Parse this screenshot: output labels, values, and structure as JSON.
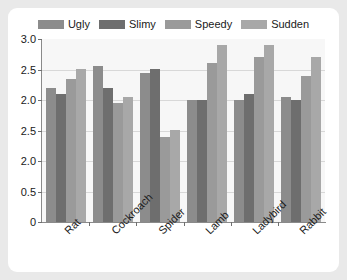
{
  "chart_data": {
    "type": "bar",
    "title": "",
    "xlabel": "",
    "ylabel": "",
    "grid": true,
    "legend_position": "top-center",
    "categories": [
      "Rat",
      "Cockroach",
      "Spider",
      "Lamb",
      "Ladybird",
      "Rabbit"
    ],
    "ytick_labels": [
      "3.0",
      "2.5",
      "2.0",
      "2.5",
      "2.0",
      "0.5",
      "0"
    ],
    "ylim": [
      0,
      3.0
    ],
    "series": [
      {
        "name": "Ugly",
        "color": "#8c8c8c",
        "values": [
          2.2,
          2.55,
          2.45,
          2.0,
          2.0,
          2.05
        ]
      },
      {
        "name": "Slimy",
        "color": "#6e6e6e",
        "values": [
          2.1,
          2.2,
          2.5,
          2.0,
          2.1,
          2.0
        ]
      },
      {
        "name": "Speedy",
        "color": "#9a9a9a",
        "values": [
          2.35,
          1.95,
          1.4,
          2.6,
          2.7,
          2.4
        ]
      },
      {
        "name": "Sudden",
        "color": "#a8a8a8",
        "values": [
          2.5,
          2.05,
          1.5,
          2.9,
          2.9,
          2.7
        ]
      }
    ]
  }
}
